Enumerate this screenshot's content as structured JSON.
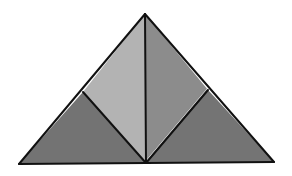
{
  "diagram": {
    "title": "",
    "background": "#ffffff",
    "stroke_color": "#111111",
    "stroke_width": 2,
    "vertices": {
      "apex": [
        145,
        14
      ],
      "bottom_left": [
        19,
        164
      ],
      "bottom_right": [
        274,
        162
      ],
      "bottom_mid": [
        146,
        163
      ],
      "left_mid": [
        83,
        92
      ],
      "right_mid": [
        208,
        90
      ]
    },
    "regions": [
      {
        "name": "bottom-left-triangle",
        "points": "19,164 83,92 146,163",
        "fill": "#737373"
      },
      {
        "name": "upper-left-triangle",
        "points": "83,92 145,14 146,163",
        "fill": "#b3b3b3"
      },
      {
        "name": "upper-right-triangle",
        "points": "145,14 208,90 146,163",
        "fill": "#8c8c8c"
      },
      {
        "name": "bottom-right-triangle",
        "points": "208,90 274,162 146,163",
        "fill": "#747474"
      }
    ],
    "segments": [
      {
        "name": "left-edge",
        "x1": 19,
        "y1": 164,
        "x2": 145,
        "y2": 14
      },
      {
        "name": "right-edge",
        "x1": 145,
        "y1": 14,
        "x2": 274,
        "y2": 162
      },
      {
        "name": "base-edge",
        "x1": 19,
        "y1": 164,
        "x2": 274,
        "y2": 162
      },
      {
        "name": "vertical-median",
        "x1": 145,
        "y1": 14,
        "x2": 146,
        "y2": 163
      },
      {
        "name": "left-inner-segment",
        "x1": 83,
        "y1": 92,
        "x2": 146,
        "y2": 163
      },
      {
        "name": "right-inner-segment",
        "x1": 208,
        "y1": 90,
        "x2": 146,
        "y2": 163
      }
    ],
    "highlight_color": "#d8d8d8"
  }
}
